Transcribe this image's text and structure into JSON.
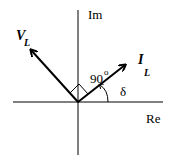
{
  "diagram": {
    "type": "phasor-diagram",
    "axes": {
      "imaginary_label": "Im",
      "real_label": "Re"
    },
    "phasors": [
      {
        "name": "V",
        "subscript": "L",
        "direction": "upper-left"
      },
      {
        "name": "I",
        "subscript": "L",
        "direction": "upper-right"
      }
    ],
    "angle_between": {
      "value": "90",
      "unit": "o"
    },
    "angle_to_real_axis": "δ"
  }
}
